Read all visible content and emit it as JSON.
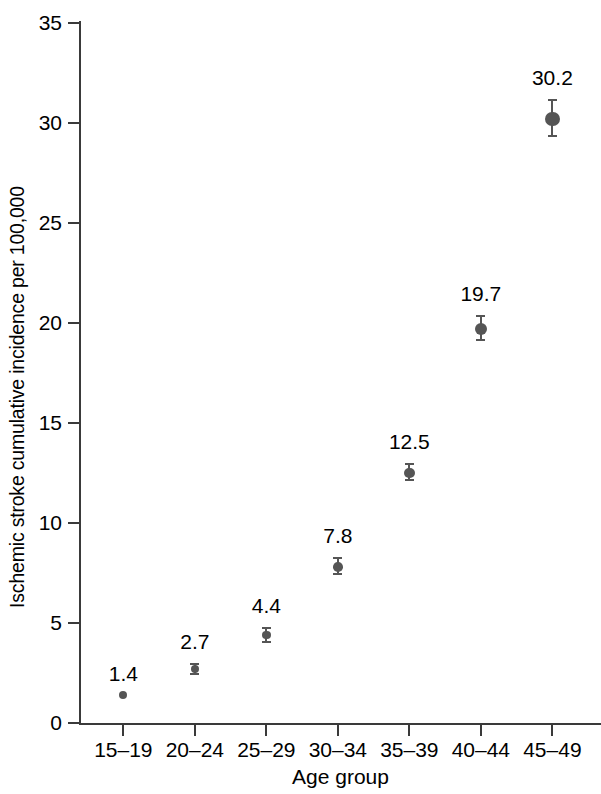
{
  "chart_data": {
    "type": "scatter",
    "title": "",
    "subtitle": "",
    "xlabel": "Age group",
    "ylabel": "Ischemic stroke cumulative incidence per 100,000",
    "categories": [
      "15–19",
      "20–24",
      "25–29",
      "30–34",
      "35–39",
      "40–44",
      "45–49"
    ],
    "values": [
      1.4,
      2.7,
      4.4,
      7.8,
      12.5,
      19.7,
      30.2
    ],
    "point_labels": [
      "1.4",
      "2.7",
      "4.4",
      "7.8",
      "12.5",
      "19.7",
      "30.2"
    ],
    "error_low": [
      1.4,
      2.4,
      4.0,
      7.4,
      12.1,
      19.1,
      29.3
    ],
    "error_high": [
      1.4,
      3.0,
      4.8,
      8.3,
      13.0,
      20.4,
      31.2
    ],
    "ylim": [
      0,
      35
    ],
    "yticks": [
      0,
      5,
      10,
      15,
      20,
      25,
      30,
      35
    ],
    "ytick_labels": [
      "0",
      "5",
      "10",
      "15",
      "20",
      "25",
      "30",
      "35"
    ],
    "grid": false,
    "legend": null,
    "marker_color": "#555555",
    "axis_color": "#3a3a3a",
    "text_color": "#000000",
    "background": "#ffffff"
  }
}
